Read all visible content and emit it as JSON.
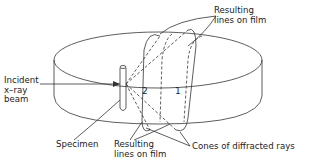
{
  "figure": {
    "labels": {
      "resulting_lines_top": "Resulting\nlines on film",
      "incident_beam": "Incident\nx–ray\nbeam",
      "specimen": "Specimen",
      "resulting_lines_bottom": "Resulting\nlines on film",
      "cones": "Cones of diffracted rays"
    },
    "cone_numbers": [
      "2",
      "1"
    ],
    "colors": {
      "ink": "#222222",
      "background": "#ffffff"
    }
  }
}
